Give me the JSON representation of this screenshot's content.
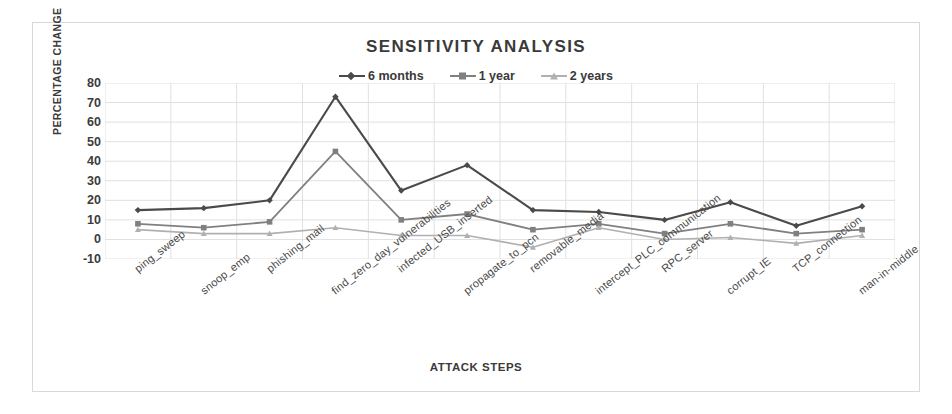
{
  "chart_data": {
    "type": "line",
    "title": "SENSITIVITY ANALYSIS",
    "xlabel": "ATTACK STEPS",
    "ylabel": "PERCENTAGE CHANGE",
    "ylim": [
      -10,
      80
    ],
    "ytick_step": 10,
    "yticks": [
      80,
      70,
      60,
      50,
      40,
      30,
      20,
      10,
      0,
      -10
    ],
    "grid": true,
    "legend_position": "top-center",
    "categories": [
      "ping_sweep",
      "snoop_emp",
      "phishing_mail",
      "find_zero_day_vulnerabilities",
      "infected_USB_inserted",
      "propagate_to_pcn",
      "removable_media",
      "intercept_PLC_communication",
      "RPC_server",
      "corrupt_IE",
      "TCP_connection",
      "man-in-middle"
    ],
    "series": [
      {
        "name": "6 months",
        "color": "#4a4a4a",
        "marker": "diamond",
        "values": [
          15,
          16,
          20,
          73,
          25,
          38,
          15,
          14,
          10,
          19,
          7,
          17
        ]
      },
      {
        "name": "1 year",
        "color": "#808080",
        "marker": "square",
        "values": [
          8,
          6,
          9,
          45,
          10,
          13,
          5,
          8,
          3,
          8,
          3,
          5
        ]
      },
      {
        "name": "2 years",
        "color": "#b0b0b0",
        "marker": "triangle",
        "values": [
          5,
          3,
          3,
          6,
          2,
          2,
          -4,
          6,
          0,
          1,
          -2,
          2
        ]
      }
    ]
  },
  "colors": {
    "frame_border": "#d8d8d8",
    "gridline": "#e0e0e0",
    "text": "#3a3a3a"
  }
}
